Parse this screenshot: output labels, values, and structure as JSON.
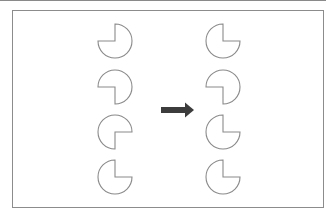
{
  "diagram": {
    "stroke_color": "#8a8a8a",
    "arrow_color": "#3c3c3c",
    "radius": 17,
    "left_column": {
      "x": 115,
      "shapes": [
        {
          "y": 41,
          "missing_quadrant": "top-left"
        },
        {
          "y": 87,
          "missing_quadrant": "bottom-left"
        },
        {
          "y": 132,
          "missing_quadrant": "bottom-right"
        },
        {
          "y": 177,
          "missing_quadrant": "top-right"
        }
      ]
    },
    "arrow": {
      "direction": "right",
      "x1": 161,
      "x2": 194,
      "y": 110
    },
    "right_column": {
      "x": 223,
      "shapes": [
        {
          "y": 41,
          "missing_quadrant": "top-right"
        },
        {
          "y": 87,
          "missing_quadrant": "bottom-left"
        },
        {
          "y": 132,
          "missing_quadrant": "top-right"
        },
        {
          "y": 177,
          "missing_quadrant": "top-right"
        }
      ]
    }
  }
}
